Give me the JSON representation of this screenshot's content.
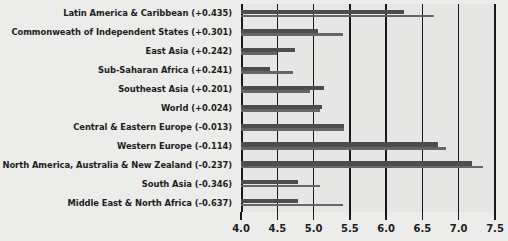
{
  "chart_data": {
    "type": "bar",
    "orientation": "horizontal",
    "title": "",
    "xlabel": "",
    "ylabel": "",
    "xlim": [
      4.0,
      7.5
    ],
    "grid": true,
    "legend": "none",
    "xticks": [
      "4.0",
      "4.5",
      "5.0",
      "5.5",
      "6.0",
      "6.5",
      "7.0",
      "7.5"
    ],
    "xtick_values": [
      4.0,
      4.5,
      5.0,
      5.5,
      6.0,
      6.5,
      7.0,
      7.5
    ],
    "categories": [
      "Latin America & Caribbean (+0.435)",
      "Commonweath of Independent States (+0.301)",
      "East Asia (+0.242)",
      "Sub-Saharan Africa (+0.241)",
      "Southeast Asia (+0.201)",
      "World (+0.024)",
      "Central & Eastern Europe (-0.013)",
      "Western Europe (-0.114)",
      "North America, Australia & New Zealand (-0.237)",
      "South Asia (-0.346)",
      "Middle East & North Africa (-0.637)"
    ],
    "deltas": [
      0.435,
      0.301,
      0.242,
      0.241,
      0.201,
      0.024,
      -0.013,
      -0.114,
      -0.237,
      -0.346,
      -0.637
    ],
    "series": [
      {
        "name": "primary",
        "values": [
          6.25,
          5.06,
          4.74,
          4.4,
          5.15,
          5.12,
          5.42,
          6.71,
          7.18,
          4.78,
          4.78
        ]
      },
      {
        "name": "secondary",
        "values": [
          6.66,
          5.4,
          4.5,
          4.72,
          4.95,
          5.09,
          5.42,
          6.82,
          7.33,
          5.09,
          5.4
        ]
      }
    ],
    "colors": {
      "primary_bar": "#4d4d4d",
      "secondary_bar": "#666666",
      "plot_background": "#e6e6e4",
      "page_background": "#ececeb",
      "axis": "#1a1a1a",
      "text": "#1d1d1d"
    }
  }
}
